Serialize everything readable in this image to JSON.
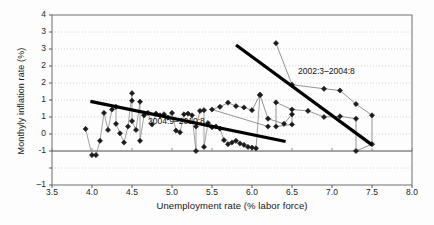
{
  "chart_data": {
    "type": "scatter",
    "title": "",
    "xlabel": "Unemployment rate (% labor force)",
    "ylabel": "Monthyly inflation rate (%)",
    "xlim": [
      3.5,
      8.0
    ],
    "ylim": [
      -1,
      4
    ],
    "grid": true,
    "legend_position": "none",
    "xticks": [
      "3.5",
      "4.0",
      "4.5",
      "5.0",
      "5.5",
      "6.0",
      "6.5",
      "7.0",
      "7.5",
      "8.0"
    ],
    "xtick_values": [
      3.5,
      4.0,
      4.5,
      5.0,
      5.5,
      6.0,
      6.5,
      7.0,
      7.5,
      8.0
    ],
    "yticks": [
      "4",
      "3",
      "3",
      "2",
      "2",
      "1",
      "1",
      "0",
      "-1"
    ],
    "ytick_values": [
      4,
      3.5,
      3,
      2.5,
      2,
      1.5,
      1,
      0.5,
      0,
      -0.5,
      -1
    ],
    "annotations": [
      {
        "name": "early-period-label",
        "text": "2002:3–2004:8",
        "x": 6.82,
        "y": 2.35
      },
      {
        "name": "late-period-label",
        "text": "2004:9–2010:8",
        "x": 4.88,
        "y": 1.35
      }
    ],
    "series": [
      {
        "name": "2002:3–2004:8",
        "marker": "diamond",
        "color": "#1c1c1c",
        "linecolor": "#7a7a7a",
        "points": [
          [
            6.3,
            3.17
          ],
          [
            6.5,
            1.95
          ],
          [
            6.9,
            1.83
          ],
          [
            7.1,
            1.78
          ],
          [
            7.3,
            1.38
          ],
          [
            7.5,
            1.05
          ],
          [
            7.5,
            0.2
          ],
          [
            7.3,
            0.0
          ],
          [
            7.3,
            0.95
          ],
          [
            7.1,
            1.02
          ],
          [
            6.9,
            1.0
          ],
          [
            6.7,
            1.18
          ],
          [
            6.5,
            1.22
          ],
          [
            6.3,
            1.43
          ],
          [
            6.3,
            0.72
          ],
          [
            6.5,
            0.78
          ],
          [
            6.5,
            1.08
          ],
          [
            6.4,
            0.8
          ],
          [
            6.2,
            0.95
          ],
          [
            6.1,
            1.65
          ],
          [
            6.0,
            1.2
          ],
          [
            5.9,
            1.28
          ],
          [
            5.8,
            1.32
          ],
          [
            5.7,
            1.42
          ],
          [
            5.6,
            1.3
          ],
          [
            5.5,
            1.22
          ],
          [
            6.2,
            0.72
          ]
        ]
      },
      {
        "name": "2004:9–2010:8",
        "marker": "diamond",
        "color": "#1c1c1c",
        "linecolor": "#8a8a8a",
        "points": [
          [
            3.92,
            0.65
          ],
          [
            4.0,
            -0.12
          ],
          [
            4.05,
            -0.12
          ],
          [
            4.1,
            0.3
          ],
          [
            4.15,
            1.12
          ],
          [
            4.2,
            0.62
          ],
          [
            4.25,
            1.22
          ],
          [
            4.3,
            1.3
          ],
          [
            4.3,
            0.8
          ],
          [
            4.35,
            0.52
          ],
          [
            4.4,
            0.25
          ],
          [
            4.45,
            0.72
          ],
          [
            4.5,
            1.7
          ],
          [
            4.5,
            1.48
          ],
          [
            4.5,
            0.88
          ],
          [
            4.55,
            0.62
          ],
          [
            4.6,
            1.45
          ],
          [
            4.6,
            0.3
          ],
          [
            4.65,
            1.05
          ],
          [
            4.7,
            1.12
          ],
          [
            4.75,
            0.78
          ],
          [
            4.8,
            1.1
          ],
          [
            4.85,
            1.05
          ],
          [
            4.9,
            1.08
          ],
          [
            4.95,
            0.98
          ],
          [
            5.0,
            1.12
          ],
          [
            5.05,
            0.6
          ],
          [
            5.1,
            0.55
          ],
          [
            5.15,
            1.08
          ],
          [
            5.2,
            1.1
          ],
          [
            5.25,
            1.05
          ],
          [
            5.3,
            0.0
          ],
          [
            5.3,
            0.72
          ],
          [
            5.35,
            1.18
          ],
          [
            5.4,
            1.2
          ],
          [
            5.4,
            0.12
          ],
          [
            5.45,
            0.82
          ],
          [
            5.5,
            0.7
          ],
          [
            5.55,
            0.72
          ],
          [
            5.6,
            0.66
          ],
          [
            5.65,
            0.32
          ],
          [
            5.7,
            0.2
          ],
          [
            5.75,
            0.25
          ],
          [
            5.8,
            0.3
          ],
          [
            5.85,
            0.22
          ],
          [
            5.9,
            0.18
          ],
          [
            5.95,
            0.12
          ],
          [
            6.0,
            0.1
          ],
          [
            6.05,
            0.08
          ],
          [
            6.1,
            1.65
          ]
        ]
      }
    ],
    "trendlines": [
      {
        "name": "early-period-trendline",
        "x0": 5.8,
        "y0": 3.12,
        "x1": 7.5,
        "y1": 0.18,
        "color": "#000000",
        "width": 3.2
      },
      {
        "name": "late-period-trendline",
        "x0": 3.98,
        "y0": 1.46,
        "x1": 6.42,
        "y1": 0.28,
        "color": "#000000",
        "width": 3.2
      }
    ]
  }
}
